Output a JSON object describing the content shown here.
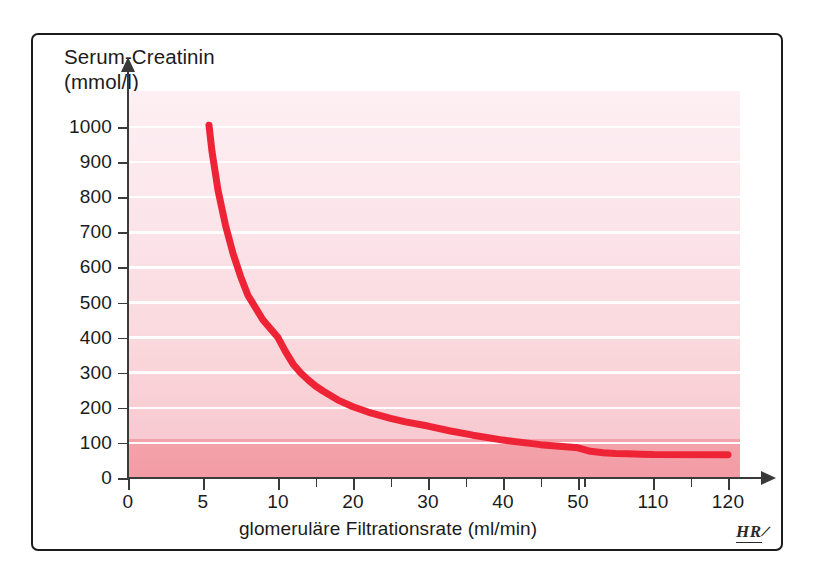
{
  "figure": {
    "signature": "HR",
    "signature_slash": "/"
  },
  "chart_data": {
    "type": "line",
    "title": "",
    "ylabel_line1": "Serum-Creatinin",
    "ylabel_line2": "(mmol/l)",
    "xlabel": "glomeruläre Filtrationsrate (ml/min)",
    "ylim": [
      0,
      1060
    ],
    "xlim": [
      0,
      130
    ],
    "grid": true,
    "legend_position": "none",
    "yticks": [
      0,
      100,
      200,
      300,
      400,
      500,
      600,
      700,
      800,
      900,
      1000
    ],
    "ytick_labels": [
      "0",
      "100",
      "200",
      "300",
      "400",
      "500",
      "600",
      "700",
      "800",
      "900",
      "1000"
    ],
    "xticks": [
      0,
      5,
      10,
      20,
      30,
      40,
      50,
      110,
      120
    ],
    "xtick_labels": [
      "0",
      "5",
      "10",
      "20",
      "30",
      "40",
      "50",
      "110",
      "120"
    ],
    "xtick_minor": [
      15,
      25,
      35,
      45,
      55,
      115,
      125
    ],
    "series": [
      {
        "name": "Serum-Creatinin vs. GFR",
        "color": "#ee2436",
        "x": [
          5.4,
          5.6,
          6,
          6.5,
          7,
          7.5,
          8,
          9,
          10,
          11,
          12,
          13,
          14,
          15,
          16,
          18,
          20,
          22,
          25,
          27,
          30,
          33,
          36,
          40,
          45,
          50,
          60,
          70,
          80,
          90,
          100,
          110,
          120,
          125
        ],
        "y": [
          1005,
          930,
          820,
          720,
          640,
          575,
          520,
          450,
          400,
          360,
          325,
          300,
          280,
          262,
          248,
          222,
          203,
          188,
          170,
          160,
          148,
          134,
          122,
          108,
          95,
          86,
          76,
          72,
          70,
          69,
          68,
          67,
          66,
          66
        ]
      }
    ],
    "bands": [
      {
        "name": "normal-range-band",
        "from": 0,
        "to": 100,
        "color": "#f4a0a9"
      }
    ],
    "background_gradient": {
      "top": "#fdeff3",
      "bottom": "#f7c4cc"
    },
    "gridline_color": "#ffffff"
  }
}
